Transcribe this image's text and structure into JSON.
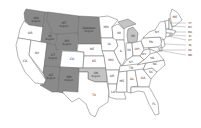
{
  "colors": {
    "background": "#ffffff",
    "dark": "#8a8a8a",
    "light": "#c4c4c4",
    "none": "#ffffff",
    "stroke": "#6a6a6a"
  },
  "states": [
    {
      "abbr": "WA",
      "sub": "Region",
      "shade": "dark"
    },
    {
      "abbr": "OR",
      "sub": "",
      "shade": "none"
    },
    {
      "abbr": "CA",
      "sub": "",
      "shade": "none"
    },
    {
      "abbr": "ID",
      "sub": "Region",
      "shade": "dark"
    },
    {
      "abbr": "NV",
      "sub": "",
      "shade": "none"
    },
    {
      "abbr": "MT",
      "sub": "Region",
      "shade": "dark"
    },
    {
      "abbr": "WY",
      "sub": "Region",
      "shade": "dark"
    },
    {
      "abbr": "UT",
      "sub": "Region",
      "shade": "dark"
    },
    {
      "abbr": "AZ",
      "sub": "Region",
      "shade": "dark"
    },
    {
      "abbr": "CO",
      "sub": "",
      "shade": "none"
    },
    {
      "abbr": "NM",
      "sub": "Region",
      "shade": "dark"
    },
    {
      "abbr": "Dakotas",
      "sub": "Region",
      "shade": "dark"
    },
    {
      "abbr": "NE",
      "sub": "",
      "shade": "none"
    },
    {
      "abbr": "KS",
      "sub": "",
      "shade": "none"
    },
    {
      "abbr": "OK",
      "sub": "Region",
      "shade": "light"
    },
    {
      "abbr": "TX",
      "sub": "",
      "shade": "none"
    },
    {
      "abbr": "MN",
      "sub": "",
      "shade": "none"
    },
    {
      "abbr": "IA",
      "sub": "",
      "shade": "none"
    },
    {
      "abbr": "MO",
      "sub": "",
      "shade": "none"
    },
    {
      "abbr": "AR",
      "sub": "",
      "shade": "none"
    },
    {
      "abbr": "LA",
      "sub": "",
      "shade": "none"
    },
    {
      "abbr": "WI",
      "sub": "",
      "shade": "none"
    },
    {
      "abbr": "IL",
      "sub": "",
      "shade": "none"
    },
    {
      "abbr": "MI",
      "sub": "",
      "shade": "light"
    },
    {
      "abbr": "IN",
      "sub": "",
      "shade": "none"
    },
    {
      "abbr": "OH",
      "sub": "",
      "shade": "none"
    },
    {
      "abbr": "KY",
      "sub": "",
      "shade": "none"
    },
    {
      "abbr": "TN",
      "sub": "",
      "shade": "none"
    },
    {
      "abbr": "MS",
      "sub": "",
      "shade": "none"
    },
    {
      "abbr": "AL",
      "sub": "",
      "shade": "none"
    },
    {
      "abbr": "GA",
      "sub": "",
      "shade": "none"
    },
    {
      "abbr": "FL",
      "sub": "",
      "shade": "none"
    },
    {
      "abbr": "SC",
      "sub": "",
      "shade": "none"
    },
    {
      "abbr": "NC",
      "sub": "",
      "shade": "none"
    },
    {
      "abbr": "VA",
      "sub": "",
      "shade": "none"
    },
    {
      "abbr": "WV",
      "sub": "",
      "shade": "none"
    },
    {
      "abbr": "PA",
      "sub": "",
      "shade": "none"
    },
    {
      "abbr": "NY",
      "sub": "",
      "shade": "none"
    },
    {
      "abbr": "ME",
      "sub": "",
      "shade": "none"
    },
    {
      "abbr": "VT",
      "sub": "",
      "shade": "none"
    },
    {
      "abbr": "NH",
      "sub": "",
      "shade": "none"
    },
    {
      "abbr": "MA",
      "sub": "",
      "shade": "none"
    },
    {
      "abbr": "RI",
      "sub": "",
      "shade": "none"
    },
    {
      "abbr": "CT",
      "sub": "",
      "shade": "none"
    },
    {
      "abbr": "NJ",
      "sub": "",
      "shade": "none"
    },
    {
      "abbr": "DE",
      "sub": "",
      "shade": "none"
    },
    {
      "abbr": "MD",
      "sub": "",
      "shade": "none"
    }
  ]
}
